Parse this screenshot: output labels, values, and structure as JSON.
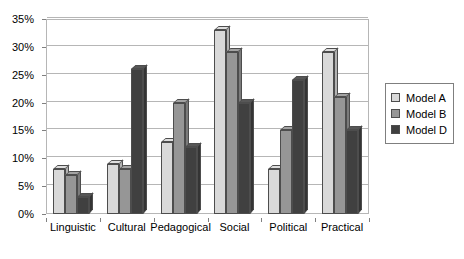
{
  "chart_data": {
    "type": "bar",
    "title": "",
    "xlabel": "",
    "ylabel": "",
    "categories": [
      "Linguistic",
      "Cultural",
      "Pedagogical",
      "Social",
      "Political",
      "Practical"
    ],
    "series": [
      {
        "name": "Model A",
        "color": "#d9d9d9",
        "values": [
          8,
          9,
          13,
          33,
          8,
          29
        ]
      },
      {
        "name": "Model B",
        "color": "#969696",
        "values": [
          7,
          8,
          20,
          29,
          15,
          21
        ]
      },
      {
        "name": "Model D",
        "color": "#404040",
        "values": [
          3,
          26,
          12,
          20,
          24,
          15
        ]
      }
    ],
    "ylim": [
      0,
      35
    ],
    "ytick_step": 5,
    "ytick_labels": [
      "0%",
      "5%",
      "10%",
      "15%",
      "20%",
      "25%",
      "30%",
      "35%"
    ],
    "ytick_values": [
      0,
      5,
      10,
      15,
      20,
      25,
      30,
      35
    ],
    "grid": true,
    "value_suffix": "%",
    "legend_position": "right",
    "style": {
      "plot_border_color": "#b6b6b6",
      "gridline_color": "#b6b6b6",
      "bar_outline_color": "#4d4d4d",
      "legend_border_color": "#7f7f7f",
      "background": "#ffffff",
      "three_d": true
    }
  },
  "legend": {
    "items": [
      {
        "label": "Model A",
        "color": "#d9d9d9"
      },
      {
        "label": "Model B",
        "color": "#969696"
      },
      {
        "label": "Model D",
        "color": "#404040"
      }
    ]
  }
}
